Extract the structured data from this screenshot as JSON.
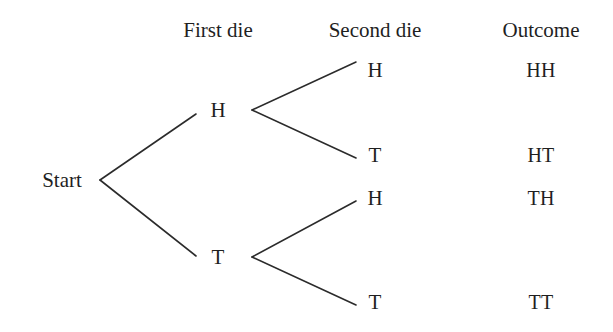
{
  "diagram": {
    "stroke_color": "#2b2b2b",
    "text_color": "#1f1f1f",
    "background_color": "#ffffff",
    "headers": [
      {
        "label": "First die",
        "x": 218,
        "y": 30
      },
      {
        "label": "Second die",
        "x": 375,
        "y": 30
      },
      {
        "label": "Outcome",
        "x": 541,
        "y": 30
      }
    ],
    "root": {
      "label": "Start",
      "x": 62,
      "y": 180
    },
    "level1": [
      {
        "label": "H",
        "x": 218,
        "y": 110
      },
      {
        "label": "T",
        "x": 218,
        "y": 257
      }
    ],
    "level2": [
      {
        "label": "H",
        "x": 375,
        "y": 70
      },
      {
        "label": "T",
        "x": 375,
        "y": 155
      },
      {
        "label": "H",
        "x": 375,
        "y": 198
      },
      {
        "label": "T",
        "x": 375,
        "y": 302
      }
    ],
    "outcomes": [
      {
        "label": "HH",
        "x": 541,
        "y": 70
      },
      {
        "label": "HT",
        "x": 541,
        "y": 155
      },
      {
        "label": "TH",
        "x": 541,
        "y": 198
      },
      {
        "label": "TT",
        "x": 541,
        "y": 302
      }
    ],
    "edges": [
      {
        "name": "edge-start-to-h",
        "x1": 100,
        "y1": 180,
        "x2": 196,
        "y2": 114
      },
      {
        "name": "edge-start-to-t",
        "x1": 100,
        "y1": 180,
        "x2": 196,
        "y2": 256
      },
      {
        "name": "edge-h-to-h",
        "x1": 252,
        "y1": 110,
        "x2": 356,
        "y2": 62
      },
      {
        "name": "edge-h-to-t",
        "x1": 252,
        "y1": 110,
        "x2": 356,
        "y2": 158
      },
      {
        "name": "edge-t-to-h",
        "x1": 252,
        "y1": 257,
        "x2": 356,
        "y2": 201
      },
      {
        "name": "edge-t-to-t",
        "x1": 252,
        "y1": 257,
        "x2": 356,
        "y2": 305
      }
    ]
  }
}
